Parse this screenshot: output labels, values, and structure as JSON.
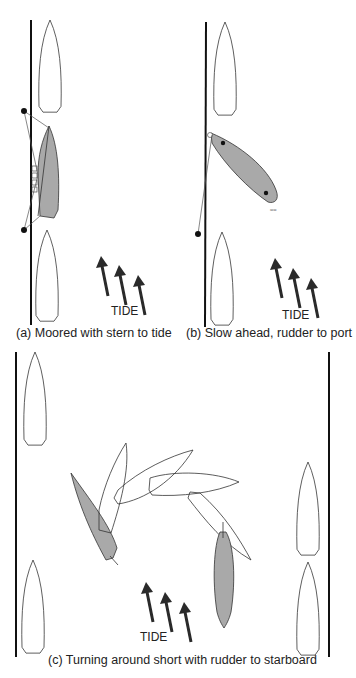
{
  "panels": [
    {
      "id": "a",
      "caption": "(a) Moored with stern to tide",
      "tide_label": "TIDE"
    },
    {
      "id": "b",
      "caption": "(b) Slow ahead, rudder to port",
      "tide_label": "TIDE"
    },
    {
      "id": "c",
      "caption": "(c) Turning around short with rudder to starboard",
      "tide_label": "TIDE"
    }
  ],
  "colors": {
    "hull_shaded": "#a9a9a9",
    "hull_outline": "#333333",
    "quay": "#111111",
    "arrow": "#2a2a2a"
  }
}
